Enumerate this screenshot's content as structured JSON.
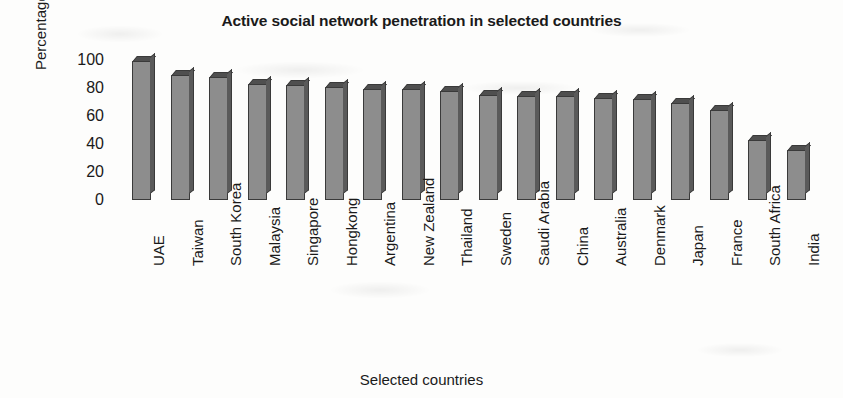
{
  "chart_data": {
    "type": "bar",
    "title": "Active social network penetration in selected countries",
    "xlabel": "Selected countries",
    "ylabel": "Percentage",
    "ylim": [
      0,
      100
    ],
    "yticks": [
      0,
      20,
      40,
      60,
      80,
      100
    ],
    "grid": false,
    "legend": null,
    "categories": [
      "UAE",
      "Taiwan",
      "South Korea",
      "Malaysia",
      "Singapore",
      "Hongkong",
      "Argentina",
      "New Zealand",
      "Thailand",
      "Sweden",
      "Saudi Arabia",
      "China",
      "Australia",
      "Denmark",
      "Japan",
      "France",
      "South Africa",
      "India"
    ],
    "values": [
      99,
      89,
      88,
      83,
      82,
      81,
      79,
      79,
      78,
      75,
      74,
      74,
      73,
      72,
      69,
      64,
      43,
      36
    ],
    "series": [
      {
        "name": "Active social network penetration",
        "values": [
          99,
          89,
          88,
          83,
          82,
          81,
          79,
          79,
          78,
          75,
          74,
          74,
          73,
          72,
          69,
          64,
          43,
          36
        ]
      }
    ],
    "colors": {
      "bar_face": "#8d8d8d",
      "bar_side": "#5a5a5a",
      "bar_top": "#4f4f4f",
      "bar_outline": "#3a3a3a",
      "background": "#fdfdfc",
      "text": "#1a1a1a"
    }
  }
}
